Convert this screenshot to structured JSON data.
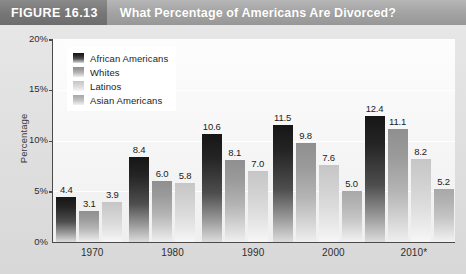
{
  "header": {
    "figure_tag": "FIGURE 16.13",
    "title": "What Percentage of Americans Are Divorced?"
  },
  "axes": {
    "ylabel": "Percentage",
    "yticks": [
      "20%",
      "15%",
      "10%",
      "5%",
      "0%"
    ],
    "xticks": [
      "1970",
      "1980",
      "1990",
      "2000",
      "2010*"
    ]
  },
  "legend": {
    "items": [
      {
        "label": "African Americans",
        "swatch": "swatch-african-americans"
      },
      {
        "label": "Whites",
        "swatch": "swatch-whites"
      },
      {
        "label": "Latinos",
        "swatch": "swatch-latinos"
      },
      {
        "label": "Asian Americans",
        "swatch": "swatch-asian-americans"
      }
    ]
  },
  "chart_data": {
    "type": "bar",
    "title": "What Percentage of Americans Are Divorced?",
    "xlabel": "",
    "ylabel": "Percentage",
    "ylim": [
      0,
      20
    ],
    "ytick_values": [
      0,
      5,
      10,
      15,
      20
    ],
    "grid": true,
    "legend_position": "upper-left-inside",
    "categories": [
      "1970",
      "1980",
      "1990",
      "2000",
      "2010*"
    ],
    "series": [
      {
        "name": "African Americans",
        "values": [
          4.4,
          8.4,
          10.6,
          11.5,
          12.4
        ]
      },
      {
        "name": "Whites",
        "values": [
          3.1,
          6.0,
          8.1,
          9.8,
          11.1
        ]
      },
      {
        "name": "Latinos",
        "values": [
          3.9,
          5.8,
          7.0,
          7.6,
          8.2
        ]
      },
      {
        "name": "Asian Americans",
        "values": [
          null,
          null,
          null,
          5.0,
          5.2
        ]
      }
    ],
    "data_labels": {
      "1970": [
        "4.4",
        "3.1",
        "3.9",
        ""
      ],
      "1980": [
        "8.4",
        "6.0",
        "5.8",
        ""
      ],
      "1990": [
        "10.6",
        "8.1",
        "7.0",
        ""
      ],
      "2000": [
        "11.5",
        "9.8",
        "7.6",
        "5.0"
      ],
      "2010*": [
        "12.4",
        "11.1",
        "8.2",
        "5.2"
      ]
    }
  },
  "colors": {
    "header_band": "#a2a2a2",
    "figure_tag_band": "#767676",
    "page_background": "#e3e3e3",
    "plot_background": "#f7f7f7",
    "axis": "#4a4a4a"
  }
}
